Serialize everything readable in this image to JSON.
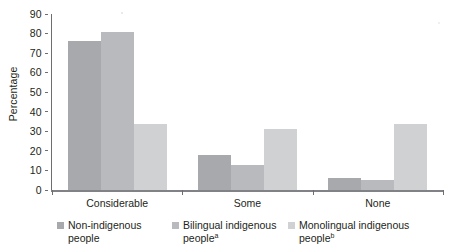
{
  "chart_data": {
    "type": "bar",
    "title": "",
    "subtitle": "",
    "xlabel": "",
    "ylabel": "Percentage",
    "categories": [
      "Considerable",
      "Some",
      "None"
    ],
    "series": [
      {
        "name": "Non-indigenous people",
        "footnote": "",
        "color": "#a7a9ac",
        "values": [
          76,
          18,
          6
        ]
      },
      {
        "name": "Bilingual indigenous people",
        "footnote": "a",
        "color": "#b8babd",
        "values": [
          81,
          13,
          5
        ]
      },
      {
        "name": "Monolingual indigenous people",
        "footnote": "b",
        "color": "#cfd1d2",
        "values": [
          34,
          31,
          34
        ]
      }
    ],
    "ylim": [
      0,
      90
    ],
    "yticks": [
      0,
      10,
      20,
      30,
      40,
      50,
      60,
      70,
      80,
      90
    ],
    "grid": false,
    "legend_position": "bottom"
  },
  "axis": {
    "y_axis_title": "Percentage"
  },
  "colors": {
    "axis": "#6d6e71",
    "baseline": "#808285",
    "text": "#231f20",
    "background": "#ffffff"
  }
}
